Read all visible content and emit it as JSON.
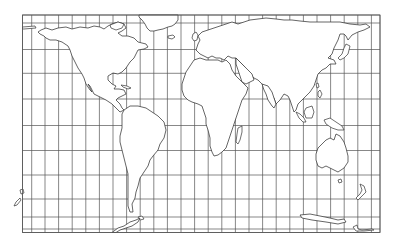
{
  "map": {
    "type": "world-outline-map",
    "projection_style": "cylindrical with graticule grid",
    "colors": {
      "background": "#ffffff",
      "grid": "#555555",
      "coastline": "#333333",
      "land_fill": "#ffffff"
    },
    "frame": {
      "left": 22.5,
      "top": 15,
      "right": 380,
      "bottom": 232.5
    },
    "grid": {
      "vertical_x": [
        22.5,
        31.7,
        45,
        58.6,
        72.2,
        85.8,
        99.4,
        113,
        126.6,
        140.2,
        153.8,
        167.4,
        181,
        194.6,
        208.2,
        221.8,
        235.4,
        249,
        262.6,
        276.2,
        289.8,
        303.4,
        317,
        330.6,
        344.2,
        357.8,
        371.4,
        380
      ],
      "horizontal_y": [
        15,
        23,
        49.5,
        73.3,
        99,
        125.5,
        150.5,
        175,
        199,
        217,
        229,
        232.5
      ]
    },
    "landmasses": [
      "north-america",
      "greenland",
      "south-america",
      "europe-asia",
      "africa",
      "australia",
      "antarctica",
      "new-zealand",
      "madagascar",
      "japan",
      "indonesia",
      "british-isles",
      "iceland",
      "pacific-islands"
    ]
  }
}
